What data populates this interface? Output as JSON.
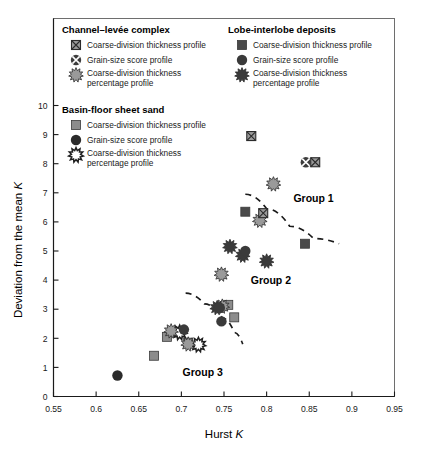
{
  "chart_data": {
    "type": "scatter",
    "title": "",
    "xlabel": "Hurst K",
    "ylabel": "Deviation from the mean K",
    "xlim": [
      0.55,
      0.95
    ],
    "ylim": [
      0,
      10
    ],
    "xticks": [
      "0.55",
      "0.6",
      "0.65",
      "0.7",
      "0.75",
      "0.8",
      "0.85",
      "0.9",
      "0.95"
    ],
    "yticks": [
      "0",
      "1",
      "2",
      "3",
      "4",
      "5",
      "6",
      "7",
      "8",
      "9",
      "10"
    ],
    "grid": false,
    "legend_position": "top-inside",
    "annotations": [
      {
        "text": "Group 1",
        "x": 0.855,
        "y": 6.7
      },
      {
        "text": "Group 2",
        "x": 0.805,
        "y": 3.85
      },
      {
        "text": "Group 3",
        "x": 0.725,
        "y": 0.72
      }
    ],
    "trendlines": [
      {
        "name": "group-1-boundary",
        "points": [
          [
            0.775,
            6.95
          ],
          [
            0.8,
            6.45
          ],
          [
            0.827,
            5.85
          ],
          [
            0.855,
            5.43
          ],
          [
            0.885,
            5.25
          ]
        ]
      },
      {
        "name": "group-2-boundary",
        "points": [
          [
            0.705,
            3.55
          ],
          [
            0.727,
            3.18
          ],
          [
            0.748,
            2.7
          ],
          [
            0.762,
            2.2
          ],
          [
            0.772,
            1.8
          ]
        ]
      }
    ],
    "series": [
      {
        "name": "Channel-levée complex - Coarse-division thickness profile",
        "marker": "square-x",
        "fill": "#9a9a9a",
        "points": [
          {
            "x": 0.782,
            "y": 8.95
          },
          {
            "x": 0.857,
            "y": 8.05
          },
          {
            "x": 0.796,
            "y": 6.3
          }
        ]
      },
      {
        "name": "Channel-levée complex - Grain-size score profile",
        "marker": "circle-x",
        "fill": "#3c3c3c",
        "points": [
          {
            "x": 0.846,
            "y": 8.05
          }
        ]
      },
      {
        "name": "Channel-levée complex - Coarse-division thickness percentage profile",
        "marker": "gear",
        "fill": "#9a9a9a",
        "points": [
          {
            "x": 0.808,
            "y": 7.3
          },
          {
            "x": 0.792,
            "y": 6.05
          },
          {
            "x": 0.747,
            "y": 4.2
          },
          {
            "x": 0.748,
            "y": 3.1
          },
          {
            "x": 0.688,
            "y": 2.25
          },
          {
            "x": 0.708,
            "y": 1.8
          }
        ]
      },
      {
        "name": "Basin-floor sheet sand - Coarse-division thickness profile",
        "marker": "square",
        "fill": "#8c8c8c",
        "points": [
          {
            "x": 0.755,
            "y": 3.15
          },
          {
            "x": 0.762,
            "y": 2.72
          },
          {
            "x": 0.708,
            "y": 1.85
          },
          {
            "x": 0.683,
            "y": 2.05
          },
          {
            "x": 0.668,
            "y": 1.4
          }
        ]
      },
      {
        "name": "Basin-floor sheet sand - Grain-size score profile",
        "marker": "circle",
        "fill": "#2b2b2b",
        "points": [
          {
            "x": 0.625,
            "y": 0.72
          }
        ]
      },
      {
        "name": "Basin-floor sheet sand - Coarse-division thickness percentage profile",
        "marker": "gear-open",
        "fill": "#ffffff",
        "points": [
          {
            "x": 0.698,
            "y": 2.2
          },
          {
            "x": 0.72,
            "y": 1.78
          }
        ]
      },
      {
        "name": "Lobe-interlobe deposits - Coarse-division thickness profile",
        "marker": "square",
        "fill": "#4a4a4a",
        "points": [
          {
            "x": 0.775,
            "y": 6.35
          },
          {
            "x": 0.845,
            "y": 5.25
          }
        ]
      },
      {
        "name": "Lobe-interlobe deposits - Grain-size score profile",
        "marker": "circle",
        "fill": "#3a3a3a",
        "points": [
          {
            "x": 0.775,
            "y": 5.0
          },
          {
            "x": 0.747,
            "y": 2.58
          },
          {
            "x": 0.745,
            "y": 3.05
          },
          {
            "x": 0.703,
            "y": 2.3
          }
        ]
      },
      {
        "name": "Lobe-interlobe deposits - Coarse-division thickness percentage profile",
        "marker": "gear",
        "fill": "#3a3a3a",
        "points": [
          {
            "x": 0.757,
            "y": 5.15
          },
          {
            "x": 0.772,
            "y": 4.85
          },
          {
            "x": 0.8,
            "y": 4.65
          },
          {
            "x": 0.742,
            "y": 3.05
          }
        ]
      }
    ]
  },
  "legend": {
    "blocks": [
      {
        "id": "channel-levee",
        "title": "Channel–levée complex",
        "items": [
          {
            "marker": "square-x",
            "label": "Coarse-division thickness profile"
          },
          {
            "marker": "circle-x",
            "label": "Grain-size score profile"
          },
          {
            "marker": "gear",
            "label_line1": "Coarse-division thickness",
            "label_line2": "percentage profile"
          }
        ]
      },
      {
        "id": "lobe-interlobe",
        "title": "Lobe-interlobe deposits",
        "items": [
          {
            "marker": "square-dark",
            "label": "Coarse-division thickness profile"
          },
          {
            "marker": "circle-dark",
            "label": "Grain-size score profile"
          },
          {
            "marker": "gear-dark",
            "label_line1": "Coarse-division thickness",
            "label_line2": "percentage profile"
          }
        ]
      },
      {
        "id": "basin-floor",
        "title": "Basin-floor sheet sand",
        "items": [
          {
            "marker": "square-gray",
            "label": "Coarse-division thickness profile"
          },
          {
            "marker": "circle-black",
            "label": "Grain-size score profile"
          },
          {
            "marker": "gear-open",
            "label_line1": "Coarse-division thickness",
            "label_line2": "percentage profile"
          }
        ]
      }
    ]
  },
  "colors": {
    "marker_light": "#9a9a9a",
    "marker_mid": "#8c8c8c",
    "marker_dark": "#3a3a3a",
    "marker_black": "#2b2b2b",
    "frame": "#6e6e6e",
    "axis": "#1a1a1a",
    "background": "#ffffff"
  }
}
